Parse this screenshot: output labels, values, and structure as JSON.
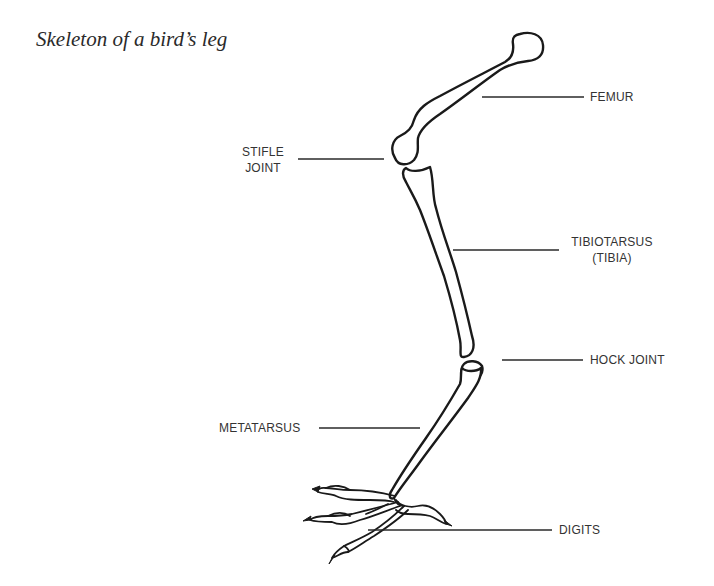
{
  "title": "Skeleton of a bird’s leg",
  "labels": {
    "femur": "FEMUR",
    "stifle_line1": "STIFLE",
    "stifle_line2": "JOINT",
    "tibiotarsus_line1": "TIBIOTARSUS",
    "tibiotarsus_line2": "(TIBIA)",
    "hock": "HOCK JOINT",
    "metatarsus": "METATARSUS",
    "digits": "DIGITS"
  },
  "colors": {
    "line": "#1a1a1a",
    "text": "#333333",
    "background": "#ffffff"
  }
}
